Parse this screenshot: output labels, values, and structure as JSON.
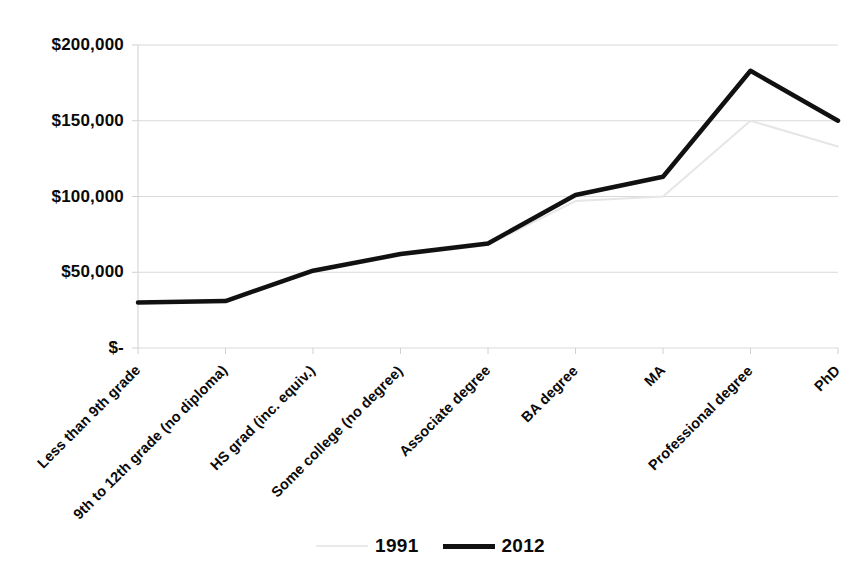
{
  "chart_data": {
    "type": "line",
    "title": "",
    "xlabel": "",
    "ylabel": "",
    "categories": [
      "Less than 9th grade",
      "9th to 12th grade (no diploma)",
      "HS grad (inc. equiv.)",
      "Some college (no degree)",
      "Associate degree",
      "BA degree",
      "MA",
      "Professional degree",
      "PhD"
    ],
    "series": [
      {
        "name": "1991",
        "color": "#e6e6e6",
        "values": [
          30000,
          31000,
          50000,
          61000,
          68000,
          97000,
          100000,
          150000,
          133000
        ]
      },
      {
        "name": "2012",
        "color": "#111111",
        "values": [
          30000,
          31000,
          51000,
          62000,
          69000,
          101000,
          113000,
          183000,
          150000
        ]
      }
    ],
    "ytick_labels": [
      "$200,000",
      "$150,000",
      "$100,000",
      "$50,000",
      "$-"
    ],
    "ytick_values": [
      200000,
      150000,
      100000,
      50000,
      0
    ],
    "ylim": [
      0,
      200000
    ],
    "grid": true,
    "legend_position": "bottom"
  },
  "legend": {
    "items": [
      {
        "label": "1991",
        "swatch": "faint-gray-line"
      },
      {
        "label": "2012",
        "swatch": "bold-black-line"
      }
    ]
  },
  "colors": {
    "series_1991": "#e6e6e6",
    "series_2012": "#111111",
    "gridline": "#d9d9d9",
    "axis": "#d0d0d0",
    "text": "#0a0a0a"
  }
}
